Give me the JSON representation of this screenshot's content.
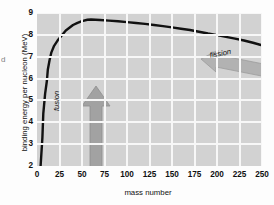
{
  "figure": {
    "edge_artifact": "d"
  },
  "chart_data": {
    "type": "line",
    "title": "",
    "xlabel": "mass number",
    "ylabel": "binding energy per nucleon (MeV)",
    "xlim": [
      0,
      250
    ],
    "ylim": [
      2,
      9
    ],
    "xticks": [
      0,
      25,
      50,
      75,
      100,
      125,
      150,
      175,
      200,
      225,
      250
    ],
    "xtick_labels": [
      "0",
      "25",
      "50",
      "75",
      "100",
      "125",
      "150",
      "175",
      "200",
      "225",
      "250"
    ],
    "yticks": [
      2,
      3,
      4,
      5,
      6,
      7,
      8,
      9
    ],
    "ytick_labels": [
      "2",
      "3",
      "4",
      "5",
      "6",
      "7",
      "8",
      "9"
    ],
    "grid": true,
    "legend": false,
    "plot_background": "#d2d2d2",
    "grid_color": "#f7f7f7",
    "line_color": "#111111",
    "series": [
      {
        "name": "binding energy per nucleon",
        "x": [
          4,
          6,
          7,
          9,
          11,
          12,
          14,
          16,
          19,
          23,
          27,
          32,
          40,
          45,
          50,
          56,
          60,
          70,
          80,
          90,
          100,
          110,
          120,
          130,
          140,
          150,
          160,
          170,
          180,
          190,
          200,
          210,
          220,
          230,
          240,
          250
        ],
        "y": [
          2.0,
          3.3,
          4.4,
          5.3,
          5.9,
          6.4,
          6.85,
          7.2,
          7.5,
          7.75,
          7.95,
          8.2,
          8.45,
          8.55,
          8.63,
          8.69,
          8.7,
          8.68,
          8.65,
          8.62,
          8.58,
          8.54,
          8.5,
          8.45,
          8.4,
          8.34,
          8.28,
          8.22,
          8.14,
          8.06,
          7.99,
          7.91,
          7.83,
          7.74,
          7.64,
          7.52
        ]
      }
    ],
    "annotations": [
      {
        "name": "fusion",
        "label": "fusion",
        "direction": "up",
        "color": "#a0a0a0",
        "x_position": 25,
        "y_range": [
          2.1,
          6.0
        ]
      },
      {
        "name": "fission",
        "label": "fission",
        "direction": "left",
        "color": "#b0b0b0",
        "x_range": [
          165,
          250
        ],
        "y_position": 7.3
      }
    ]
  }
}
